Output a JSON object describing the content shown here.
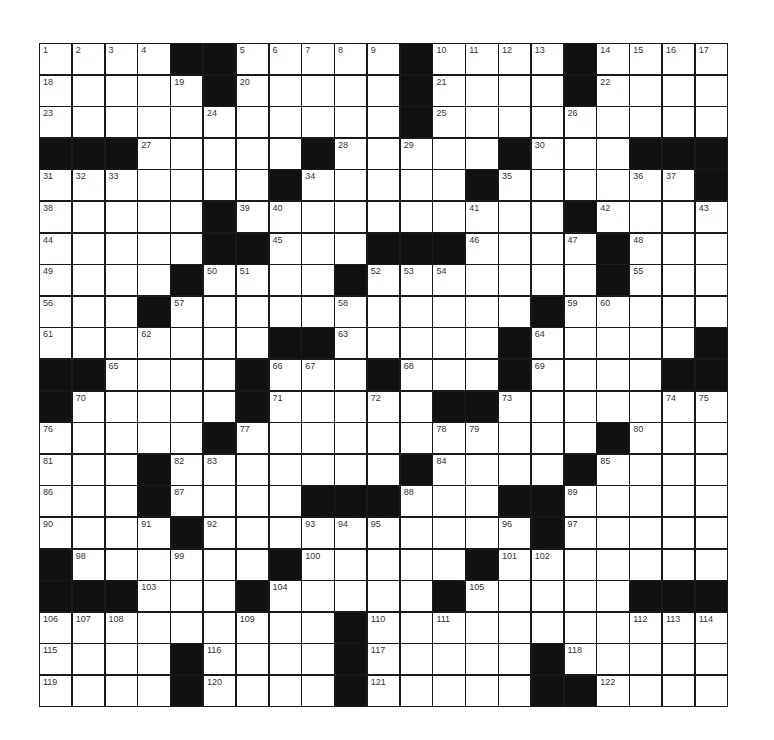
{
  "puzzle": {
    "rows": 21,
    "cols": 21,
    "colors": {
      "block": "#111111",
      "cell": "#ffffff",
      "line": "#1a1a1a",
      "number": "#333333"
    },
    "grid": [
      "1,2,3,4,#,#,5,6,7,8,9,#,10,11,12,13,#,14,15,16,17",
      "18,.,.,.,19,#,20,.,.,.,.,#,21,.,.,.,#,22,.,.,.",
      "23,.,.,.,.,24,.,.,.,.,.,#,25,.,.,.,26,.,.,.,.",
      "#,#,#,27,.,.,.,.,#,28,.,29,.,.,#,30,.,.,#,#,#",
      "31,32,33,.,.,.,.,#,34,.,.,.,.,#,35,.,.,.,36,37,#",
      "38,.,.,.,.,#,39,40,.,.,.,.,.,41,.,.,#,42,.,.,43",
      "44,.,.,.,.,#,#,45,.,.,#,#,#,46,.,.,47,#,48,.,.",
      "49,.,.,.,#,50,51,.,.,#,52,53,54,.,.,.,.,#,55,.,.",
      "56,.,.,#,57,.,.,.,.,58,.,.,.,.,.,#,59,60,.,.,.",
      "61,.,.,62,.,.,.,#,#,63,.,.,.,.,#,64,.,.,.,.,#",
      "#,#,65,.,.,.,#,66,67,.,#,68,.,.,#,69,.,.,.,#,#",
      "#,70,.,.,.,.,#,71,.,.,72,.,#,#,73,.,.,.,.,74,75",
      "76,.,.,.,.,#,77,.,.,.,.,.,78,79,.,.,.,#,80,.,.",
      "81,.,.,#,82,83,.,.,.,.,.,#,84,.,.,.,#,85,.,.,.",
      "86,.,.,#,87,.,.,.,#,#,#,88,.,.,#,#,89,.,.,.,.",
      "90,.,.,91,#,92,.,.,93,94,95,.,.,.,96,#,97,.,.,.,.",
      "#,98,.,.,99,.,.,#,100,.,.,.,.,#,101,102,.,.,.,.,.",
      "#,#,#,103,.,.,#,104,.,.,.,.,#,105,.,.,.,.,#,#,#",
      "106,107,108,.,.,.,109,.,.,#,110,.,111,.,.,.,.,.,112,113,114",
      "115,.,.,.,#,116,.,.,.,#,117,.,.,.,.,#,118,.,.,.,.",
      "119,.,.,.,#,120,.,.,.,#,121,.,.,.,.,#,#,122,.,.,."
    ]
  }
}
